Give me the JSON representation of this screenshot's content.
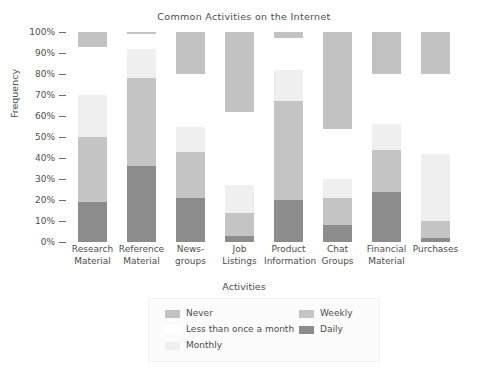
{
  "chart_data": {
    "type": "bar",
    "subtype": "stacked-bar-100-percent",
    "title": "Common Activities on the Internet",
    "xlabel": "Activities",
    "ylabel": "Frequency",
    "ylim": [
      0,
      100
    ],
    "grid": false,
    "legend_position": "bottom",
    "ytick_labels": [
      "100%",
      "90%",
      "80%",
      "70%",
      "60%",
      "50%",
      "40%",
      "30%",
      "20%",
      "10%",
      "0%"
    ],
    "ytick_values": [
      100,
      90,
      80,
      70,
      60,
      50,
      40,
      30,
      20,
      10,
      0
    ],
    "categories": [
      "Research Material",
      "Reference Material",
      "News-groups",
      "Job Listings",
      "Product Information",
      "Chat Groups",
      "Financial Material",
      "Purchases"
    ],
    "category_lines": [
      [
        "Research",
        "Material"
      ],
      [
        "Reference",
        "Material"
      ],
      [
        "News-",
        "groups"
      ],
      [
        "Job",
        "Listings"
      ],
      [
        "Product",
        "Information"
      ],
      [
        "Chat",
        "Groups"
      ],
      [
        "Financial",
        "Material"
      ],
      [
        "Purchases",
        ""
      ]
    ],
    "series": [
      {
        "name": "Daily",
        "color": "#8c8c8c",
        "values": [
          19,
          36,
          21,
          3,
          20,
          8,
          24,
          2
        ]
      },
      {
        "name": "Weekly",
        "color": "#c4c4c4",
        "values": [
          31,
          42,
          22,
          11,
          47,
          13,
          20,
          8
        ]
      },
      {
        "name": "Monthly",
        "color": "#efefef",
        "values": [
          20,
          14,
          12,
          13,
          15,
          9,
          12,
          32
        ]
      },
      {
        "name": "Less than once a month",
        "color": "#ffffff",
        "values": [
          23,
          7,
          25,
          35,
          15,
          24,
          24,
          38
        ]
      },
      {
        "name": "Never",
        "color": "#c2c2c2",
        "values": [
          7,
          1,
          20,
          38,
          3,
          46,
          20,
          20
        ]
      }
    ],
    "stack_order_bottom_to_top": [
      "Daily",
      "Weekly",
      "Monthly",
      "Less than once a month",
      "Never"
    ]
  },
  "legend": {
    "entries": [
      {
        "label": "Never",
        "color": "#c2c2c2",
        "column": "left",
        "row": 0
      },
      {
        "label": "Less than once a month",
        "color": "#ffffff",
        "column": "left",
        "row": 1
      },
      {
        "label": "Monthly",
        "color": "#efefef",
        "column": "left",
        "row": 2
      },
      {
        "label": "Weekly",
        "color": "#c4c4c4",
        "column": "right",
        "row": 0
      },
      {
        "label": "Daily",
        "color": "#8c8c8c",
        "column": "right",
        "row": 1
      }
    ]
  }
}
